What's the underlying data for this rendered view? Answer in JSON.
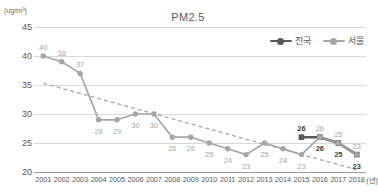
{
  "chart_data": {
    "type": "line",
    "title": "PM2.5",
    "ylabel": "(ug/m³)",
    "xlabel": "(년)",
    "categories": [
      "2001",
      "2002",
      "2003",
      "2004",
      "2005",
      "2006",
      "2007",
      "2008",
      "2009",
      "2010",
      "2011",
      "2012",
      "2013",
      "2014",
      "2015",
      "2016",
      "2017",
      "2018"
    ],
    "ylim": [
      20,
      45
    ],
    "yticks": [
      20,
      25,
      30,
      35,
      40,
      45
    ],
    "grid": true,
    "legend_position": "top-right",
    "series": [
      {
        "name": "전국",
        "color": "#595959",
        "marker": "square",
        "values": [
          null,
          null,
          null,
          null,
          null,
          null,
          null,
          null,
          null,
          null,
          null,
          null,
          null,
          null,
          26,
          26,
          25,
          23
        ],
        "labels": [
          "",
          "",
          "",
          "",
          "",
          "",
          "",
          "",
          "",
          "",
          "",
          "",
          "",
          "",
          "26",
          "26",
          "25",
          "23"
        ]
      },
      {
        "name": "서울",
        "color": "#a6a6a6",
        "marker": "circle",
        "values": [
          40,
          39,
          37,
          29,
          29,
          30,
          30,
          26,
          26,
          25,
          24,
          23,
          25,
          24,
          23,
          26,
          25,
          23
        ],
        "labels": [
          "40",
          "38",
          "37",
          "29",
          "29",
          "30",
          "30",
          "26",
          "26",
          "25",
          "24",
          "23",
          "25",
          "24",
          "23",
          "26",
          "25",
          "23"
        ]
      }
    ],
    "trendline": {
      "name": "trend",
      "style": "dashed",
      "color": "#a6a6a6",
      "start": 35.3,
      "end": 20.4
    }
  },
  "legend": {
    "items": [
      {
        "label": "전국"
      },
      {
        "label": "서울"
      }
    ]
  }
}
